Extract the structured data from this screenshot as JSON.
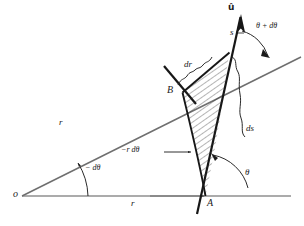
{
  "figure": {
    "type": "geometry-diagram",
    "background_color": "#ffffff",
    "ink_color": "#1a1a1a",
    "axis_color": "#8a8a8a",
    "hatch_color": "#2b2b2b"
  },
  "labels": {
    "origin": "o",
    "point_a": "A",
    "point_b": "B",
    "radius_ray": "r",
    "radius_axis": "r",
    "arc_length": "s",
    "unit_vector": "û",
    "delta_r": "dr",
    "delta_s": "ds",
    "minus_r_dtheta": "−r dθ",
    "minus_dtheta": "− dθ",
    "theta": "θ",
    "theta_plus_dtheta": "θ + dθ"
  },
  "geometry": {
    "origin_point": [
      22,
      196
    ],
    "point_a": [
      205,
      196
    ],
    "point_b": [
      182,
      92
    ],
    "ray_end": [
      300,
      58
    ],
    "axis_end": [
      291,
      196
    ],
    "tangent_arrow_tip": [
      240,
      15
    ],
    "radius_value": "r",
    "angle_theta_deg": 73,
    "angle_theta_plus_dtheta_deg": 79
  }
}
